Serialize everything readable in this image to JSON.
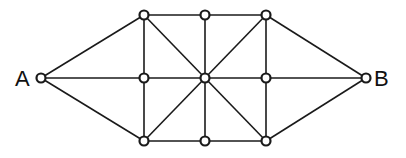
{
  "diagram": {
    "type": "graph",
    "labels": {
      "A": "A",
      "B": "B"
    },
    "nodes": [
      {
        "id": "A",
        "x": 41,
        "y": 78,
        "label": "A"
      },
      {
        "id": "TL",
        "x": 144,
        "y": 15
      },
      {
        "id": "TM",
        "x": 205,
        "y": 15
      },
      {
        "id": "TR",
        "x": 266,
        "y": 15
      },
      {
        "id": "ML",
        "x": 144,
        "y": 78
      },
      {
        "id": "C",
        "x": 205,
        "y": 78
      },
      {
        "id": "MR",
        "x": 266,
        "y": 78
      },
      {
        "id": "BL",
        "x": 144,
        "y": 141
      },
      {
        "id": "BM",
        "x": 205,
        "y": 141
      },
      {
        "id": "BR",
        "x": 266,
        "y": 141
      },
      {
        "id": "B",
        "x": 366,
        "y": 78,
        "label": "B"
      }
    ],
    "edges": [
      [
        "A",
        "TL"
      ],
      [
        "A",
        "ML"
      ],
      [
        "A",
        "BL"
      ],
      [
        "B",
        "TR"
      ],
      [
        "B",
        "MR"
      ],
      [
        "B",
        "BR"
      ],
      [
        "TL",
        "TM"
      ],
      [
        "TM",
        "TR"
      ],
      [
        "BL",
        "BM"
      ],
      [
        "BM",
        "BR"
      ],
      [
        "ML",
        "C"
      ],
      [
        "C",
        "MR"
      ],
      [
        "TL",
        "ML"
      ],
      [
        "ML",
        "BL"
      ],
      [
        "TM",
        "C"
      ],
      [
        "C",
        "BM"
      ],
      [
        "TR",
        "MR"
      ],
      [
        "MR",
        "BR"
      ],
      [
        "TL",
        "C"
      ],
      [
        "C",
        "BR"
      ],
      [
        "TR",
        "C"
      ],
      [
        "C",
        "BL"
      ]
    ],
    "colors": {
      "stroke": "#1a1a1a",
      "node_fill": "#ffffff",
      "background": "#ffffff"
    }
  }
}
